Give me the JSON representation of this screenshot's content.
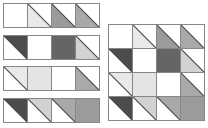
{
  "figure": {
    "cell_pitch_px": 24,
    "border_color": "#878787",
    "diagonal_color": "#4a4a4a",
    "background": "#ffffff"
  },
  "palette": {
    "white": "#ffffff",
    "lightest_gray": "#e9e9e9",
    "light_gray": "#d2d2d2",
    "medium_light_gray": "#a9a9a9",
    "medium_gray": "#9b9b9b",
    "dark_full_gray": "#656565",
    "dark_gray": "#4c4c4c"
  },
  "strips": [
    {
      "name": "strip-1",
      "cells": [
        {
          "shape": "empty",
          "fill": "#ffffff"
        },
        {
          "shape": "triangle-lower-left",
          "fill": "#e9e9e9"
        },
        {
          "shape": "triangle-lower-left",
          "fill": "#9b9b9b"
        },
        {
          "shape": "triangle-lower-left",
          "fill": "#a9a9a9"
        }
      ]
    },
    {
      "name": "strip-2",
      "cells": [
        {
          "shape": "triangle-upper-right",
          "fill": "#4c4c4c"
        },
        {
          "shape": "empty",
          "fill": "#ffffff"
        },
        {
          "shape": "full",
          "fill": "#656565"
        },
        {
          "shape": "triangle-lower-left",
          "fill": "#d2d2d2"
        }
      ]
    },
    {
      "name": "strip-3",
      "cells": [
        {
          "shape": "triangle-upper-right",
          "fill": "#e9e9e9"
        },
        {
          "shape": "full",
          "fill": "#e4e4e4"
        },
        {
          "shape": "empty",
          "fill": "#ffffff"
        },
        {
          "shape": "triangle-lower-left",
          "fill": "#a9a9a9"
        }
      ]
    },
    {
      "name": "strip-4",
      "cells": [
        {
          "shape": "triangle-upper-right",
          "fill": "#4c4c4c"
        },
        {
          "shape": "triangle-upper-right",
          "fill": "#d2d2d2"
        },
        {
          "shape": "triangle-upper-right",
          "fill": "#a9a9a9"
        },
        {
          "shape": "full",
          "fill": "#9b9b9b"
        }
      ]
    }
  ],
  "grid": {
    "name": "assembled-grid",
    "rows": [
      {
        "cells": [
          {
            "shape": "empty",
            "fill": "#ffffff"
          },
          {
            "shape": "triangle-lower-left",
            "fill": "#e9e9e9"
          },
          {
            "shape": "triangle-lower-left",
            "fill": "#9b9b9b"
          },
          {
            "shape": "triangle-lower-left",
            "fill": "#a9a9a9"
          }
        ]
      },
      {
        "cells": [
          {
            "shape": "triangle-upper-right",
            "fill": "#4c4c4c"
          },
          {
            "shape": "empty",
            "fill": "#ffffff"
          },
          {
            "shape": "full",
            "fill": "#656565"
          },
          {
            "shape": "triangle-lower-left",
            "fill": "#d2d2d2"
          }
        ]
      },
      {
        "cells": [
          {
            "shape": "triangle-upper-right",
            "fill": "#e9e9e9"
          },
          {
            "shape": "full",
            "fill": "#e4e4e4"
          },
          {
            "shape": "empty",
            "fill": "#ffffff"
          },
          {
            "shape": "triangle-lower-left",
            "fill": "#a9a9a9"
          }
        ]
      },
      {
        "cells": [
          {
            "shape": "triangle-upper-right",
            "fill": "#4c4c4c"
          },
          {
            "shape": "triangle-upper-right",
            "fill": "#d2d2d2"
          },
          {
            "shape": "triangle-upper-right",
            "fill": "#a9a9a9"
          },
          {
            "shape": "full",
            "fill": "#9b9b9b"
          }
        ]
      }
    ]
  }
}
